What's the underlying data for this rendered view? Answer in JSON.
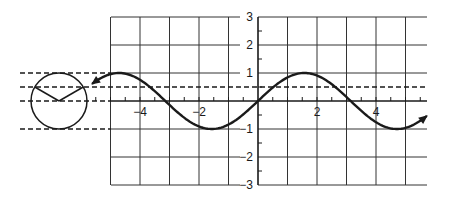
{
  "figure": {
    "line_color": "#1a1a1a",
    "grid_color": "#333333",
    "background": "#ffffff"
  },
  "chart_data": {
    "type": "line",
    "title": "",
    "xlabel": "",
    "ylabel": "",
    "function": "y = sin(x)",
    "xlim": [
      -5.0,
      5.7
    ],
    "ylim": [
      -3,
      3
    ],
    "grid": true,
    "x_tick_labels": [
      "-4",
      "-2",
      "2",
      "4"
    ],
    "x_tick_values": [
      -4,
      -2,
      2,
      4
    ],
    "y_tick_labels": [
      "3",
      "2",
      "1",
      "-1",
      "-2",
      "-3"
    ],
    "y_tick_values": [
      3,
      2,
      1,
      -1,
      -2,
      -3
    ],
    "curve_domain": [
      -5.6,
      5.7
    ],
    "curve_arrows": [
      "left",
      "right"
    ],
    "series": [
      {
        "name": "sin(x)",
        "x": [
          -5.6,
          -4.712,
          -3.1416,
          -1.5708,
          0,
          1.5708,
          3.1416,
          4.712,
          5.7
        ],
        "y": [
          0.63,
          1,
          0,
          -1,
          0,
          1,
          0,
          -1,
          -0.55
        ]
      }
    ],
    "reference_lines": [
      {
        "y": 1,
        "style": "dashed",
        "extent": "left"
      },
      {
        "y": 0.5,
        "style": "dashed",
        "extent": "full"
      },
      {
        "y": 0,
        "style": "dashed",
        "extent": "left"
      },
      {
        "y": -1,
        "style": "dashed",
        "extent": "left"
      }
    ],
    "unit_circle": {
      "center_y": 0,
      "radius_units": 1,
      "rays_to_y": 0.5
    }
  }
}
